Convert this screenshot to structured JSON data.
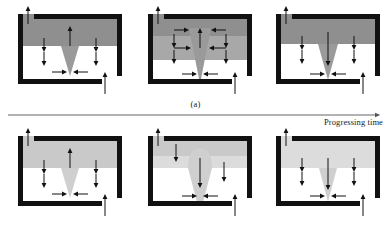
{
  "figure": {
    "type": "schematic-diagram-grid",
    "rows": 2,
    "columns": 3,
    "sublabel_a": "(a)",
    "sublabel_b": "(b)",
    "time_axis_label": "Progressing time",
    "colors": {
      "frame": "#111111",
      "background": "#ffffff",
      "shade_dark": "#8f8f8f",
      "shade_mid": "#a8a8a8",
      "shade_light": "#c9c9c9",
      "shade_pale": "#dcdcdc",
      "cone": "#9a9a9a",
      "cone_light": "#cfcfcf",
      "arrow": "#111111",
      "axis_line": "#555555",
      "text": "#1a1a1a"
    },
    "panels": [
      {
        "id": "a1",
        "row": "a",
        "index": 1,
        "shade_layers": [
          {
            "name": "upper-band",
            "tone": "shade_dark",
            "top": 12,
            "height": 32
          },
          {
            "name": "lower-region",
            "tone": "background",
            "top": 44,
            "height": 36
          }
        ],
        "cone": {
          "depth": "shallow",
          "tone": "cone",
          "apex_y": 72,
          "mouth_y": 44,
          "half_width": 9
        },
        "arrows": {
          "inlet_top_left": "up",
          "inlet_bottom_right": "up",
          "interior_vertical_center": "up",
          "interior_vertical_sides": "down",
          "tip_horizontal": "converging"
        }
      },
      {
        "id": "a2",
        "row": "a",
        "index": 2,
        "shade_layers": [
          {
            "name": "upper-band",
            "tone": "shade_dark",
            "top": 12,
            "height": 22
          },
          {
            "name": "middle-band",
            "tone": "shade_mid",
            "top": 34,
            "height": 24
          },
          {
            "name": "lower-region",
            "tone": "background",
            "top": 58,
            "height": 24
          }
        ],
        "cone": {
          "depth": "deep",
          "tone": "cone",
          "apex_y": 80,
          "mouth_y": 26,
          "half_width": 11
        },
        "arrows": {
          "inlet_top_left": "up",
          "inlet_bottom_right": "up",
          "interior_vertical_center": "up",
          "interior_vertical_sides": "down",
          "upper_horizontal": "converging",
          "middle_horizontal": "converging",
          "tip_horizontal": "converging"
        }
      },
      {
        "id": "a3",
        "row": "a",
        "index": 3,
        "shade_layers": [
          {
            "name": "upper-band",
            "tone": "shade_dark",
            "top": 12,
            "height": 30
          },
          {
            "name": "lower-region",
            "tone": "background",
            "top": 42,
            "height": 38
          }
        ],
        "cone": {
          "depth": "medium",
          "tone": "cone",
          "apex_y": 76,
          "mouth_y": 42,
          "half_width": 10
        },
        "arrows": {
          "inlet_top_left": "up",
          "inlet_bottom_right": "up",
          "interior_vertical_center": "down",
          "interior_vertical_sides": "down",
          "tip_horizontal": "converging"
        }
      },
      {
        "id": "b1",
        "row": "b",
        "index": 1,
        "shade_layers": [
          {
            "name": "upper-band",
            "tone": "shade_light",
            "top": 12,
            "height": 32
          },
          {
            "name": "lower-region",
            "tone": "background",
            "top": 44,
            "height": 36
          }
        ],
        "cone": {
          "depth": "shallow",
          "tone": "cone_light",
          "apex_y": 72,
          "mouth_y": 44,
          "half_width": 9
        },
        "arrows": {
          "inlet_top_left": "up",
          "inlet_bottom_right": "up",
          "interior_vertical_center": "up",
          "interior_vertical_sides": "down",
          "tip_horizontal": "converging"
        }
      },
      {
        "id": "b2",
        "row": "b",
        "index": 2,
        "shade_layers": [
          {
            "name": "upper-band",
            "tone": "shade_light",
            "top": 12,
            "height": 20
          },
          {
            "name": "middle-band",
            "tone": "shade_pale",
            "top": 32,
            "height": 12
          },
          {
            "name": "lower-region",
            "tone": "background",
            "top": 44,
            "height": 36
          }
        ],
        "cone": {
          "depth": "deep-bulged",
          "tone": "cone_light",
          "apex_y": 80,
          "mouth_y": 26,
          "half_width": 12,
          "bulge": true
        },
        "arrows": {
          "inlet_top_left": "up",
          "inlet_bottom_right": "up",
          "interior_vertical_center": "down",
          "interior_vertical_left": "down",
          "interior_vertical_right": "down",
          "tip_horizontal": "converging"
        }
      },
      {
        "id": "b3",
        "row": "b",
        "index": 3,
        "shade_layers": [
          {
            "name": "upper-band",
            "tone": "shade_pale",
            "top": 12,
            "height": 32
          },
          {
            "name": "lower-region",
            "tone": "background",
            "top": 44,
            "height": 36
          }
        ],
        "cone": {
          "depth": "medium",
          "tone": "cone_light",
          "apex_y": 76,
          "mouth_y": 44,
          "half_width": 10
        },
        "arrows": {
          "inlet_top_left": "up",
          "inlet_bottom_right": "up",
          "interior_vertical_center": "down",
          "interior_vertical_sides": "down",
          "tip_horizontal": "converging"
        }
      }
    ]
  }
}
